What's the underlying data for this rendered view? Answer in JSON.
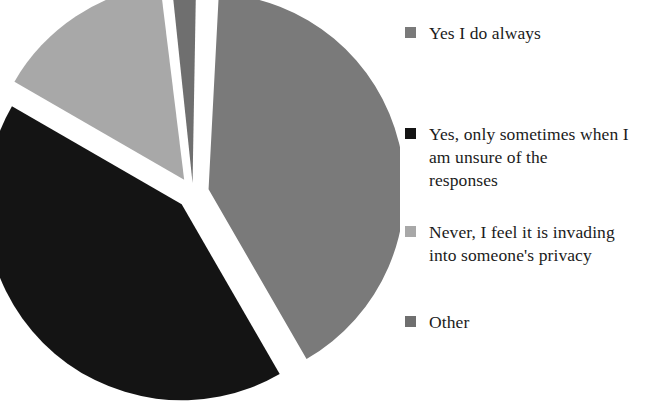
{
  "figure": {
    "background_color": "#ffffff",
    "type": "exploded-pie-chart"
  },
  "chart_data": {
    "type": "pie",
    "title": "",
    "subtitle": "",
    "xlabel": "",
    "ylabel": "",
    "grid": false,
    "legend_position": "right",
    "exploded": true,
    "start_angle_deg": 0,
    "direction": "clockwise",
    "categories": [
      "Yes I do always",
      "Yes, only sometimes when I am unsure of the responses",
      "Never, I feel it is invading into someone's privacy",
      "Other"
    ],
    "values": [
      41,
      42,
      15,
      2
    ],
    "value_unit": "percent",
    "colors": [
      "#7a7a7a",
      "#141414",
      "#a8a8a8",
      "#6f6f6f"
    ],
    "slices": [
      {
        "label": "Yes I do always",
        "value": 41,
        "color": "#7a7a7a",
        "start_angle_deg": 3,
        "end_angle_deg": 150,
        "explode_offset_px": 16
      },
      {
        "label": "Yes, only sometimes when I am unsure of the responses",
        "value": 42,
        "color": "#141414",
        "start_angle_deg": 150,
        "end_angle_deg": 300,
        "explode_offset_px": 16
      },
      {
        "label": "Never, I feel it is invading into someone's privacy",
        "value": 15,
        "color": "#a8a8a8",
        "start_angle_deg": 300,
        "end_angle_deg": 353,
        "explode_offset_px": 16
      },
      {
        "label": "Other",
        "value": 2,
        "color": "#6f6f6f",
        "start_angle_deg": 354,
        "end_angle_deg": 361,
        "explode_offset_px": 10
      }
    ],
    "geometry": {
      "center_x": 193,
      "center_y": 193,
      "radius": 196
    }
  },
  "legend": {
    "items": [
      {
        "label": "Yes I do always",
        "color": "#7a7a7a"
      },
      {
        "label": "Yes, only sometimes when I\nam unsure of the\nresponses",
        "color": "#141414"
      },
      {
        "label": "Never, I feel it is invading\ninto someone's privacy",
        "color": "#a8a8a8"
      },
      {
        "label": "Other",
        "color": "#6f6f6f"
      }
    ]
  }
}
